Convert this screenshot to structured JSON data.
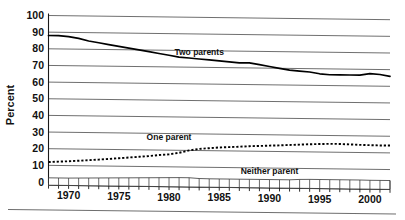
{
  "chart_data": {
    "type": "line",
    "title": "",
    "xlabel": "",
    "ylabel": "Percent",
    "xlim": [
      1968,
      2002
    ],
    "ylim": [
      0,
      100
    ],
    "grid": true,
    "legend_position": "inline-labels",
    "y_ticks": [
      0,
      10,
      20,
      30,
      40,
      50,
      60,
      70,
      80,
      90,
      100
    ],
    "y_tick_labels": [
      "0",
      "10",
      "20",
      "30",
      "40",
      "50",
      "60",
      "70",
      "80",
      "90",
      "100"
    ],
    "x_ticks": [
      1968,
      1969,
      1970,
      1971,
      1972,
      1973,
      1974,
      1975,
      1976,
      1977,
      1978,
      1979,
      1980,
      1981,
      1982,
      1983,
      1984,
      1985,
      1986,
      1987,
      1988,
      1989,
      1990,
      1991,
      1992,
      1993,
      1994,
      1995,
      1996,
      1997,
      1998,
      1999,
      2000,
      2001,
      2002
    ],
    "x_tick_labels_shown": [
      "1970",
      "1975",
      "1980",
      "1985",
      "1990",
      "1995",
      "2000"
    ],
    "x_tick_label_values": [
      1970,
      1975,
      1980,
      1985,
      1990,
      1995,
      2000
    ],
    "x": [
      1968,
      1969,
      1970,
      1971,
      1972,
      1973,
      1974,
      1975,
      1976,
      1977,
      1978,
      1979,
      1980,
      1981,
      1982,
      1983,
      1984,
      1985,
      1986,
      1987,
      1988,
      1989,
      1990,
      1991,
      1992,
      1993,
      1994,
      1995,
      1996,
      1997,
      1998,
      1999,
      2000,
      2001,
      2002
    ],
    "series": [
      {
        "name": "Two parents",
        "style": "solid",
        "label": "Two parents",
        "values": [
          88,
          88,
          87.5,
          86.5,
          85,
          84,
          83,
          82,
          81,
          80,
          79,
          78,
          77,
          76,
          75.5,
          75,
          74.5,
          74,
          73.5,
          73,
          73,
          72,
          71,
          70,
          69,
          68.5,
          68,
          67,
          66.5,
          66.5,
          66.5,
          66.5,
          67.5,
          67,
          66
        ]
      },
      {
        "name": "One parent",
        "style": "dotted",
        "label": "One parent",
        "values": [
          12,
          12.3,
          12.6,
          13,
          13.4,
          13.8,
          14.3,
          14.8,
          15.3,
          15.8,
          16.3,
          17,
          17.5,
          18.5,
          20,
          21,
          21.5,
          22,
          22.3,
          22.6,
          23,
          23.2,
          23.5,
          23.7,
          24,
          24.3,
          24.6,
          24.8,
          25,
          25,
          24.8,
          24.6,
          24.5,
          24.4,
          24.4
        ]
      },
      {
        "name": "Neither parent",
        "style": "band",
        "label": "Neither parent",
        "values": [
          2.5,
          2.5,
          2.5,
          2.6,
          2.7,
          2.8,
          2.9,
          3,
          3.1,
          3.2,
          3.3,
          3.4,
          3.5,
          3.6,
          3.6,
          3.2,
          3.1,
          3.1,
          3.1,
          3.1,
          3.1,
          3.1,
          3.1,
          3.1,
          3.1,
          3.4,
          3.5,
          3.5,
          3.5,
          3.5,
          3.5,
          3.5,
          3.4,
          3.4,
          3.4
        ]
      }
    ],
    "annotations": [
      {
        "text": "Two parents",
        "x": 1983,
        "y": 79
      },
      {
        "text": "One parent",
        "x": 1980,
        "y": 28
      },
      {
        "text": "Neither parent",
        "x": 1990,
        "y": 8
      }
    ]
  }
}
